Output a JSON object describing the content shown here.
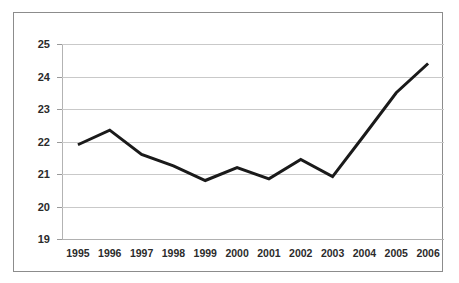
{
  "chart_data": {
    "type": "line",
    "title": "",
    "subtitle": "",
    "xlabel": "",
    "ylabel": "",
    "categories": [
      "1995",
      "1996",
      "1997",
      "1998",
      "1999",
      "2000",
      "2001",
      "2002",
      "2003",
      "2004",
      "2005",
      "2006"
    ],
    "series": [
      {
        "name": "",
        "values": [
          21.9,
          22.35,
          21.6,
          21.25,
          20.8,
          21.2,
          20.85,
          21.45,
          20.92,
          22.2,
          23.5,
          24.4
        ]
      }
    ],
    "ylim": [
      19,
      25
    ],
    "y_ticks": [
      19,
      20,
      21,
      22,
      23,
      24,
      25
    ],
    "y_tick_labels": [
      "19",
      "20",
      "21",
      "22",
      "23",
      "24",
      "25"
    ],
    "grid": "horizontal",
    "legend": "none",
    "line_color": "#1a1a1a",
    "gridline_color": "#c9c9c9",
    "axis_color": "#b3b3b3",
    "border_color": "#8c8c8c",
    "background_color": "#ffffff",
    "label_color": "#2b2b2b"
  }
}
